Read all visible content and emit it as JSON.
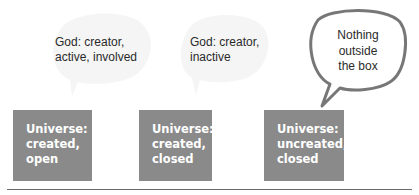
{
  "captions": [
    {
      "id": "god-creator-active",
      "lines": [
        "God: creator,",
        "active, involved"
      ]
    },
    {
      "id": "god-creator-inactive",
      "lines": [
        "God: creator,",
        "inactive"
      ]
    }
  ],
  "bubble": {
    "lines": [
      "Nothing",
      "outside",
      "the box"
    ]
  },
  "boxes": [
    {
      "lines": [
        "Universe:",
        "created,",
        "open"
      ]
    },
    {
      "lines": [
        "Universe:",
        "created,",
        "closed"
      ]
    },
    {
      "lines": [
        "Universe:",
        "uncreated,",
        "closed"
      ]
    }
  ],
  "colors": {
    "box": "#8a8a8a",
    "bubble_outline": "#777777",
    "faint_bubble": "#f4f4f4",
    "rule": "#6a6a6a"
  }
}
